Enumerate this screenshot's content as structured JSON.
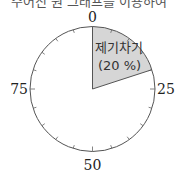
{
  "header": {
    "cut_text": "주어진 원 그래프를 이용하여"
  },
  "chart_data": {
    "type": "pie",
    "title": "",
    "scale": {
      "min": 0,
      "max": 100,
      "labels": [
        "0",
        "25",
        "50",
        "75"
      ],
      "tick_step": 5
    },
    "slices": [
      {
        "label": "제기차기",
        "value": 20,
        "display": "(20 %)",
        "color": "#d6d6d6"
      },
      {
        "label": "",
        "value": 80,
        "color": "#ffffff"
      }
    ]
  },
  "labels": {
    "zero": "0",
    "twentyfive": "25",
    "fifty": "50",
    "seventyfive": "75",
    "slice_name": "제기차기",
    "slice_pct": "(20 %)"
  },
  "colors": {
    "slice_fill": "#d6d6d6",
    "stroke": "#555555"
  }
}
